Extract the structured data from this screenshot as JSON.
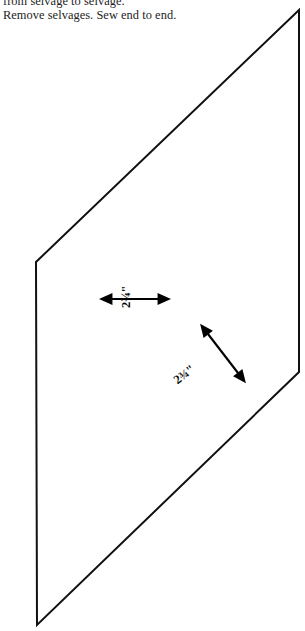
{
  "document": {
    "title": "Quilt cutting diagram",
    "instructions": [
      "from selvage to selvage.",
      "Remove selvages. Sew end to end."
    ]
  },
  "diagram": {
    "shape_name": "parallelogram",
    "stroke_color": "#111111",
    "fill_color": "#ffffff",
    "stroke_width": 2,
    "vertices": [
      {
        "name": "top-right",
        "x": 299,
        "y": 10
      },
      {
        "name": "left-upper",
        "x": 36,
        "y": 262
      },
      {
        "name": "bottom-left",
        "x": 37,
        "y": 625
      },
      {
        "name": "right-lower",
        "x": 299,
        "y": 372
      }
    ]
  },
  "measurements": [
    {
      "id": "width-measure",
      "label": "2¾\"",
      "value": "2 3/4",
      "unit": "inch",
      "orientation": "horizontal",
      "arrow": {
        "x1": 112,
        "y1": 299,
        "x2": 158,
        "y2": 299
      }
    },
    {
      "id": "diagonal-measure",
      "label": "2¾\"",
      "value": "2 3/4",
      "unit": "inch",
      "orientation": "diagonal",
      "arrow": {
        "x1": 208,
        "y1": 334,
        "x2": 238,
        "y2": 373
      }
    }
  ]
}
